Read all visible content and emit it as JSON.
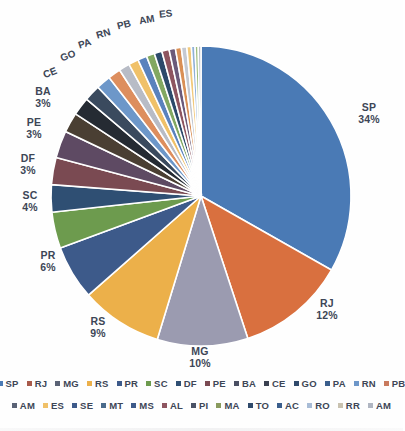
{
  "chart_data": {
    "type": "pie",
    "title": "",
    "subtitle": "",
    "xlabel": "",
    "ylabel": "",
    "legend_position": "bottom",
    "grid": false,
    "categories": [
      "SP",
      "RJ",
      "MG",
      "RS",
      "PR",
      "SC",
      "DF",
      "PE",
      "BA",
      "CE",
      "GO",
      "PA",
      "RN",
      "PB",
      "AM",
      "ES",
      "SE",
      "MT",
      "MS",
      "AL",
      "PI",
      "MA",
      "TO",
      "AC",
      "RO",
      "RR",
      "AM"
    ],
    "values": [
      34,
      12,
      10,
      9,
      6,
      4,
      3,
      3,
      3,
      2.2,
      2,
      1.8,
      1.6,
      1.4,
      1.2,
      1.1,
      1.0,
      0.9,
      0.85,
      0.8,
      0.7,
      0.65,
      0.6,
      0.5,
      0.4,
      0.35,
      0.3
    ],
    "unit": "%",
    "labeled_slices": [
      {
        "label": "SP",
        "pct": "34%"
      },
      {
        "label": "RJ",
        "pct": "12%"
      },
      {
        "label": "MG",
        "pct": "10%"
      },
      {
        "label": "RS",
        "pct": "9%"
      },
      {
        "label": "PR",
        "pct": "6%"
      },
      {
        "label": "SC",
        "pct": "4%"
      },
      {
        "label": "DF",
        "pct": "3%"
      },
      {
        "label": "PE",
        "pct": "3%"
      },
      {
        "label": "BA",
        "pct": "3%"
      }
    ],
    "unlabeled_callouts": [
      "CE",
      "GO",
      "PA",
      "RN",
      "PB",
      "AM",
      "ES"
    ],
    "colors": [
      "#4a7ab5",
      "#d9703f",
      "#9b9bb0",
      "#ecb04a",
      "#3d5a8a",
      "#6d9b4e",
      "#2f4f73",
      "#7a4a52",
      "#5e4a63",
      "#4a3f33",
      "#252b33",
      "#3a4a5e",
      "#6d97c9",
      "#dd8e5e",
      "#b8bcc6",
      "#f0c169",
      "#5a82bd",
      "#82a862",
      "#2c4a6b",
      "#8e5560",
      "#6b5a7a",
      "#d98f55",
      "#c5c9d1",
      "#f2c97a",
      "#8fb0d8",
      "#9dbd7c",
      "#b0b6c2"
    ]
  },
  "legend": {
    "row1": [
      {
        "label": "SP",
        "color": "#4a7ab5"
      },
      {
        "label": "RJ",
        "color": "#a85a4a"
      },
      {
        "label": "MG",
        "color": "#5a6275"
      },
      {
        "label": "RS",
        "color": "#ecb04a"
      },
      {
        "label": "PR",
        "color": "#3d5a8a"
      },
      {
        "label": "SC",
        "color": "#6d9b4e"
      },
      {
        "label": "DF",
        "color": "#2f4f73"
      },
      {
        "label": "PE",
        "color": "#7a4a52"
      },
      {
        "label": "BA",
        "color": "#4a4f63"
      },
      {
        "label": "CE",
        "color": "#3a4050"
      },
      {
        "label": "GO",
        "color": "#2f4a6b"
      },
      {
        "label": "PA",
        "color": "#3a5e8c"
      },
      {
        "label": "RN",
        "color": "#6d97c9"
      },
      {
        "label": "PB",
        "color": "#c97a5e"
      }
    ],
    "row2": [
      {
        "label": "AM",
        "color": "#5a6275"
      },
      {
        "label": "ES",
        "color": "#f0c169"
      },
      {
        "label": "SE",
        "color": "#3d5a8a"
      },
      {
        "label": "MT",
        "color": "#4a6b8c"
      },
      {
        "label": "MS",
        "color": "#3d5a8a"
      },
      {
        "label": "AL",
        "color": "#8e5560"
      },
      {
        "label": "PI",
        "color": "#4a5266"
      },
      {
        "label": "MA",
        "color": "#8a9b5e"
      },
      {
        "label": "TO",
        "color": "#2f4a6b"
      },
      {
        "label": "AC",
        "color": "#3a5e8c"
      },
      {
        "label": "RO",
        "color": "#a8bcd6"
      },
      {
        "label": "RR",
        "color": "#c9c2b0"
      },
      {
        "label": "AM",
        "color": "#b0b6c2"
      }
    ]
  }
}
